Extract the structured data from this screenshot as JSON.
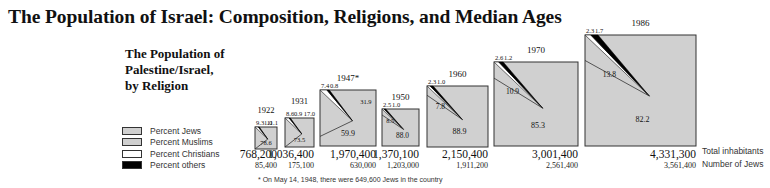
{
  "title": "The Population of Israel: Composition, Religions, and Median Ages",
  "subtitle": [
    "The Population of",
    "Palestine/Israel,",
    "by Religion"
  ],
  "legend": [
    {
      "label": "Percent Jews",
      "color": "#d0d0d0"
    },
    {
      "label": "Percent Muslims",
      "color": "#d0d0d0"
    },
    {
      "label": "Percent Christians",
      "color": "#ffffff"
    },
    {
      "label": "Percent others",
      "color": "#000000"
    }
  ],
  "row_labels": {
    "total": "Total inhabitants",
    "jews": "Number of Jews"
  },
  "footnote": "* On May 14, 1948, there were 649,600 Jews in the country",
  "chart_data": {
    "type": "pie",
    "title": "The Population of Palestine/Israel, by Religion",
    "categories": [
      "1922",
      "1931",
      "1947*",
      "1950",
      "1960",
      "1970",
      "1986"
    ],
    "series": [
      {
        "name": "Percent Jews",
        "values": [
          11.1,
          17.0,
          31.9,
          88.0,
          88.9,
          85.3,
          82.2
        ]
      },
      {
        "name": "Percent Muslims",
        "values": [
          78.6,
          73.5,
          59.9,
          8.5,
          7.8,
          10.9,
          13.8
        ]
      },
      {
        "name": "Percent Christians",
        "values": [
          9.3,
          8.6,
          7.4,
          2.5,
          2.3,
          2.6,
          2.3
        ]
      },
      {
        "name": "Percent others",
        "values": [
          1.0,
          0.9,
          0.8,
          1.0,
          1.0,
          1.2,
          1.7
        ]
      }
    ],
    "total_inhabitants": [
      "768,200",
      "1,036,400",
      "1,970,400",
      "1,370,100",
      "2,150,400",
      "3,001,400",
      "4,331,300"
    ],
    "number_of_jews": [
      "85,400",
      "175,100",
      "630,000",
      "1,203,000",
      "1,911,200",
      "2,561,400",
      "3,561,400"
    ],
    "legend_position": "left"
  }
}
